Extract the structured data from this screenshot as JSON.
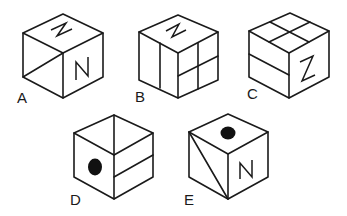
{
  "figure": {
    "cubes": [
      {
        "label": "A",
        "top_face": "letter-N (rotated)",
        "left_face": "diagonal line",
        "right_face": "letter-N"
      },
      {
        "label": "B",
        "top_face": "letter-N (rotated)",
        "left_face": "vertical line (half split)",
        "right_face": "2x2 grid"
      },
      {
        "label": "C",
        "top_face": "2x2 grid",
        "left_face": "horizontal line (half split)",
        "right_face": "letter-Z"
      },
      {
        "label": "D",
        "top_face": "line from center to back corner",
        "left_face": "black dot",
        "right_face": "horizontal line (half split)"
      },
      {
        "label": "E",
        "top_face": "black dot",
        "left_face": "diagonal line",
        "right_face": "letter-N"
      }
    ]
  },
  "colors": {
    "line": "#1a1a1a",
    "dot": "#111111",
    "background": "#ffffff"
  }
}
